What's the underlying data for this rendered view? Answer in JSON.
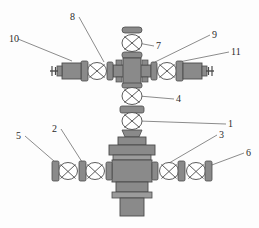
{
  "diagram": {
    "type": "technical-line-diagram",
    "background_color": "#fdfdfd",
    "stroke_color": "#4a4a4a",
    "fill_color": "#8a8a8a",
    "fill_color_light": "#9b9b9b",
    "fill_color_dark": "#7a7a7a",
    "label_color": "#2b2b2b"
  },
  "callouts": [
    {
      "id": "c1",
      "number": "1",
      "x": 228,
      "y": 119,
      "anchor_x": 139,
      "anchor_y": 121
    },
    {
      "id": "c2",
      "number": "2",
      "x": 52,
      "y": 124,
      "anchor_x": 84,
      "anchor_y": 165
    },
    {
      "id": "c3",
      "number": "3",
      "x": 219,
      "y": 130,
      "anchor_x": 164,
      "anchor_y": 166
    },
    {
      "id": "c4",
      "number": "4",
      "x": 176,
      "y": 94,
      "anchor_x": 139,
      "anchor_y": 96
    },
    {
      "id": "c5",
      "number": "5",
      "x": 16,
      "y": 131,
      "anchor_x": 62,
      "anchor_y": 168
    },
    {
      "id": "c6",
      "number": "6",
      "x": 246,
      "y": 148,
      "anchor_x": 193,
      "anchor_y": 172
    },
    {
      "id": "c7",
      "number": "7",
      "x": 156,
      "y": 41,
      "anchor_x": 138,
      "anchor_y": 43
    },
    {
      "id": "c8",
      "number": "8",
      "x": 70,
      "y": 12,
      "anchor_x": 104,
      "anchor_y": 62
    },
    {
      "id": "c9",
      "number": "9",
      "x": 212,
      "y": 30,
      "anchor_x": 155,
      "anchor_y": 62
    },
    {
      "id": "c10",
      "number": "10",
      "x": 9,
      "y": 34,
      "anchor_x": 72,
      "anchor_y": 61
    },
    {
      "id": "c11",
      "number": "11",
      "x": 231,
      "y": 47,
      "anchor_x": 179,
      "anchor_y": 62
    }
  ],
  "components": {
    "top_cap": "top-cap",
    "top_valve": "swab-valve",
    "upper_cross": "upper-cross-hub",
    "left_wing_valve": "left-wing-valve",
    "right_wing_valve": "right-wing-valve",
    "left_choke": "left-choke-body",
    "right_choke": "right-choke-body",
    "upper_master_valve": "upper-master-valve",
    "lower_master_valve": "lower-master-valve",
    "lower_cross": "lower-cross-hub",
    "casing_head": "casing-head-stem",
    "lower_left_valves": "lower-left-valve-pair",
    "lower_right_valves": "lower-right-valve-pair"
  }
}
